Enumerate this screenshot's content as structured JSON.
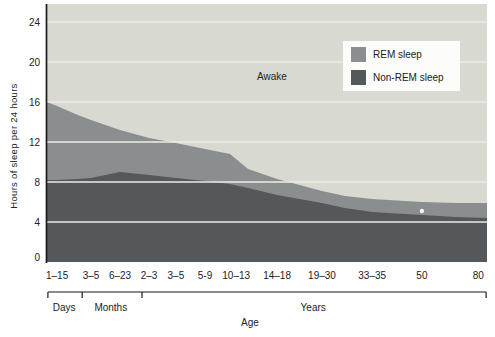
{
  "chart_data": {
    "type": "area",
    "stacked": true,
    "title": "",
    "ylabel": "Hours of sleep per 24 hours",
    "xlabel": "Age",
    "ylim": [
      0,
      25.8
    ],
    "yticks": [
      0,
      4,
      8,
      12,
      16,
      20,
      24
    ],
    "grid": "horizontal-white-lines",
    "legend_position": "top-right-inside",
    "categories": [
      {
        "label": "1–15",
        "x": 0.023
      },
      {
        "label": "3–5",
        "x": 0.1
      },
      {
        "label": "6–23",
        "x": 0.166
      },
      {
        "label": "2–3",
        "x": 0.232
      },
      {
        "label": "3–5",
        "x": 0.293
      },
      {
        "label": "5-9",
        "x": 0.359
      },
      {
        "label": "10–13",
        "x": 0.43
      },
      {
        "label": "14–18",
        "x": 0.523
      },
      {
        "label": "19–30",
        "x": 0.625
      },
      {
        "label": "33–35",
        "x": 0.739
      },
      {
        "label": "50",
        "x": 0.852
      },
      {
        "label": "80",
        "x": 0.98
      }
    ],
    "axis_groups": {
      "start": 0.002,
      "end": 0.998,
      "ticks": [
        0.002,
        0.08,
        0.216,
        0.998
      ],
      "labels": [
        {
          "label": "Days",
          "x": 0.039
        },
        {
          "label": "Months",
          "x": 0.145
        },
        {
          "label": "Years",
          "x": 0.605
        }
      ]
    },
    "series": [
      {
        "name": "REM sleep",
        "values": [
          7.4,
          5.8,
          4.2,
          3.7,
          3.5,
          3.2,
          2.9,
          1.6,
          1.2,
          1.3,
          1.3,
          1.5
        ]
      },
      {
        "name": "Non-REM sleep",
        "values": [
          8.2,
          8.4,
          9.0,
          8.7,
          8.4,
          8.1,
          7.7,
          6.7,
          5.9,
          5.0,
          4.7,
          4.4
        ]
      }
    ],
    "total_sleep_hours": [
      15.6,
      14.2,
      13.2,
      12.4,
      11.9,
      11.3,
      10.6,
      8.3,
      7.1,
      6.3,
      6.0,
      5.9
    ],
    "boundary_points": [
      {
        "x": 0.0,
        "total": 16.0,
        "nonrem": 8.2
      },
      {
        "x": 0.023,
        "total": 15.6,
        "nonrem": 8.2
      },
      {
        "x": 0.07,
        "total": 14.7,
        "nonrem": 8.3
      },
      {
        "x": 0.1,
        "total": 14.2,
        "nonrem": 8.4
      },
      {
        "x": 0.166,
        "total": 13.2,
        "nonrem": 9.0
      },
      {
        "x": 0.232,
        "total": 12.4,
        "nonrem": 8.7
      },
      {
        "x": 0.293,
        "total": 11.9,
        "nonrem": 8.4
      },
      {
        "x": 0.359,
        "total": 11.3,
        "nonrem": 8.1
      },
      {
        "x": 0.416,
        "total": 10.8,
        "nonrem": 7.8
      },
      {
        "x": 0.457,
        "total": 9.3,
        "nonrem": 7.4
      },
      {
        "x": 0.523,
        "total": 8.3,
        "nonrem": 6.7
      },
      {
        "x": 0.625,
        "total": 7.1,
        "nonrem": 5.9
      },
      {
        "x": 0.677,
        "total": 6.6,
        "nonrem": 5.4
      },
      {
        "x": 0.739,
        "total": 6.3,
        "nonrem": 5.0
      },
      {
        "x": 0.852,
        "total": 6.0,
        "nonrem": 4.7
      },
      {
        "x": 0.93,
        "total": 5.9,
        "nonrem": 4.5
      },
      {
        "x": 1.0,
        "total": 5.9,
        "nonrem": 4.4
      }
    ],
    "annotations": {
      "awake": "Awake"
    },
    "marker_dot": {
      "x": 0.852,
      "hours": 5.1
    },
    "colors": {
      "awake_fill": "#d8d9d1",
      "rem_fill": "#8a8e8e",
      "nonrem_fill": "#54585b",
      "gridline": "#ebece6",
      "axis": "#1b1b1b",
      "legend_bg": "#fcfcfa",
      "text": "#21211f",
      "marker_dot": "#f3f3ef"
    }
  }
}
